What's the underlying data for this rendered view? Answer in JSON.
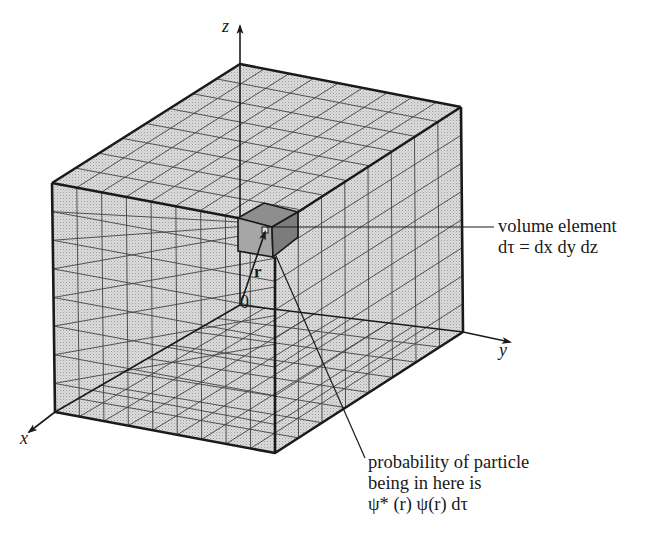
{
  "figure": {
    "axes": {
      "x_label": "x",
      "y_label": "y",
      "z_label": "z",
      "origin_label": "0"
    },
    "vector_label": "r",
    "annotations": {
      "volume_element": {
        "line1": "volume element",
        "line2": "dτ = dx dy dz"
      },
      "probability": {
        "line1": "probability of particle",
        "line2": "being in here is",
        "line3": "ψ* (r) ψ(r) dτ"
      }
    },
    "colors": {
      "box_fill": "#d4d4d4",
      "element_fill": "#9a9a9a",
      "line": "#1a1a1a",
      "background": "#ffffff"
    },
    "grid": {
      "divisions_x": 8,
      "divisions_y": 9,
      "divisions_z": 8
    }
  }
}
